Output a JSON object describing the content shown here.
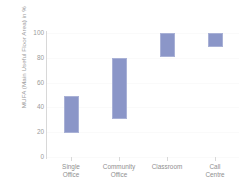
{
  "chart_data": {
    "type": "bar",
    "bar_style": "floating-range",
    "title": "",
    "xlabel": "",
    "ylabel": "MUFA (Main Useful Floor Area) in %",
    "categories": [
      "Single Office",
      "Community Office",
      "Classroom",
      "Call Centre"
    ],
    "category_lines": [
      [
        "Single",
        "Office"
      ],
      [
        "Community",
        "Office"
      ],
      [
        "Classroom"
      ],
      [
        "Call Centre"
      ]
    ],
    "series": [
      {
        "name": "MUFA range",
        "low": [
          19,
          31,
          81,
          89
        ],
        "high": [
          49,
          80,
          100,
          100
        ]
      }
    ],
    "ylim": [
      0,
      100
    ],
    "yticks": [
      0,
      20,
      40,
      60,
      80,
      100
    ],
    "ytick_labels": [
      "0",
      "20",
      "40",
      "60",
      "80",
      "100"
    ],
    "grid": true,
    "legend": "none",
    "colors": {
      "bar_fill": "#8b96c8",
      "bar_border": "#a9b1d6",
      "gridline": "#fafafa",
      "axis": "#d8d8d8",
      "tick_text": "#9a9a9a",
      "category_text": "#8f8f8f",
      "background": "#ffffff"
    }
  }
}
